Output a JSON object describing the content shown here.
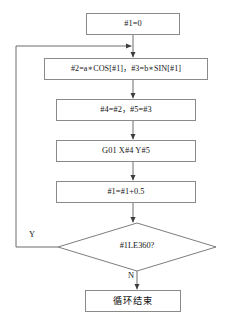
{
  "diagram": {
    "type": "flowchart",
    "nodes": [
      {
        "id": "init",
        "shape": "process",
        "text": "#1=0",
        "x": 86,
        "y": 13,
        "width": 94,
        "height": 22
      },
      {
        "id": "compute-xy",
        "shape": "process",
        "text": "#2=a∗COS[#1]，#3=b∗SIN[#1]",
        "x": 44,
        "y": 58,
        "width": 164,
        "height": 22
      },
      {
        "id": "assign",
        "shape": "process",
        "text": "#4=#2，#5=#3",
        "x": 56,
        "y": 99,
        "width": 140,
        "height": 22
      },
      {
        "id": "move",
        "shape": "process",
        "text": "G01 X#4 Y#5",
        "x": 56,
        "y": 140,
        "width": 140,
        "height": 22
      },
      {
        "id": "increment",
        "shape": "process",
        "text": "#1=#1+0.5",
        "x": 56,
        "y": 181,
        "width": 140,
        "height": 22
      },
      {
        "id": "condition",
        "shape": "decision",
        "text": "#1LE360?",
        "cx": 137,
        "cy": 247,
        "half_width": 79,
        "half_height": 24
      },
      {
        "id": "end",
        "shape": "process",
        "text": "循环结束",
        "x": 85,
        "y": 290,
        "width": 96,
        "height": 22
      }
    ],
    "edge_labels": [
      {
        "id": "yes-branch",
        "text": "Y",
        "x": 29,
        "y": 230
      },
      {
        "id": "no-branch",
        "text": "N",
        "x": 128,
        "y": 271
      }
    ]
  }
}
